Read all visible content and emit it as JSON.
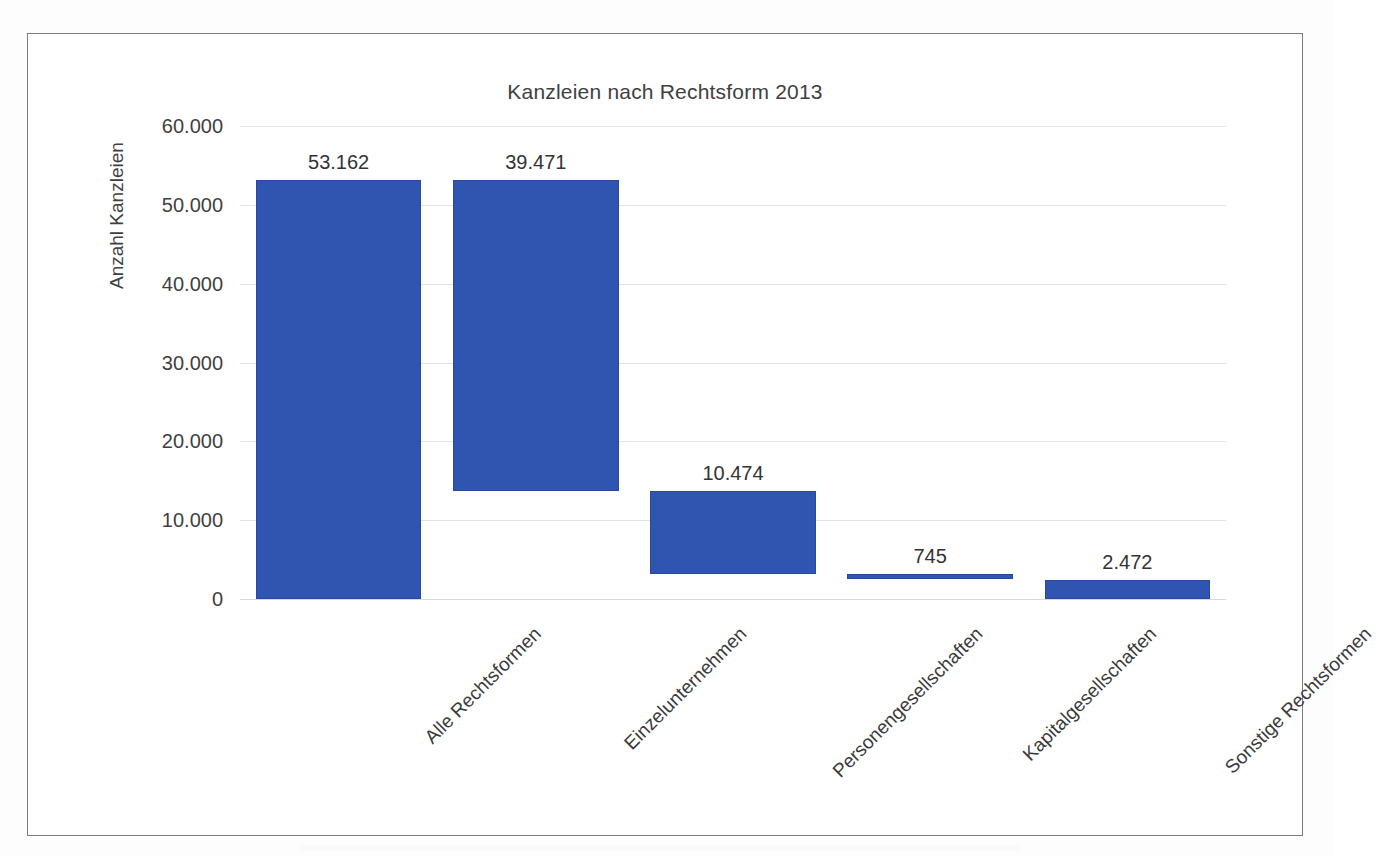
{
  "document": {
    "type": "scanned-figure-page",
    "frame_color": "#7c7c7c"
  },
  "chart_data": {
    "type": "bar",
    "subtype": "waterfall",
    "title": "Kanzleien nach Rechtsform 2013",
    "xlabel": "",
    "ylabel": "Anzahl Kanzleien",
    "ylim": [
      0,
      60000
    ],
    "grid": true,
    "legend": "none",
    "yticks": [
      0,
      10000,
      20000,
      30000,
      40000,
      50000,
      60000
    ],
    "ytick_labels": [
      "0",
      "10.000",
      "20.000",
      "30.000",
      "40.000",
      "50.000",
      "60.000"
    ],
    "categories": [
      "Alle Rechtsformen",
      "Einzelunternehmen",
      "Personengesellschaften",
      "Kapitalgesellschaften",
      "Sonstige Rechtsformen"
    ],
    "values": [
      53162,
      39471,
      10474,
      745,
      2472
    ],
    "value_labels": [
      "53.162",
      "39.471",
      "10.474",
      "745",
      "2.472"
    ],
    "bar_base": [
      0,
      13691,
      3217,
      2472,
      0
    ],
    "bar_top": [
      53162,
      53162,
      13691,
      3217,
      2472
    ],
    "series": [
      {
        "name": "Anzahl Kanzleien",
        "color": "#2f55b0",
        "values": [
          53162,
          39471,
          10474,
          745,
          2472
        ]
      }
    ]
  }
}
